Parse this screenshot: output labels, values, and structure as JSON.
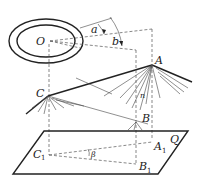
{
  "figure": {
    "type": "geometry-diagram",
    "labels": {
      "O": "O",
      "a": "a",
      "b": "b",
      "A": "A",
      "C": "C",
      "B": "B",
      "n": "n",
      "Q": "Q",
      "C1": "C",
      "C1_sub": "1",
      "A1": "A",
      "A1_sub": "1",
      "B1": "B",
      "B1_sub": "1",
      "beta": "β"
    },
    "colors": {
      "stroke": "#222222",
      "background": "#ffffff"
    }
  }
}
